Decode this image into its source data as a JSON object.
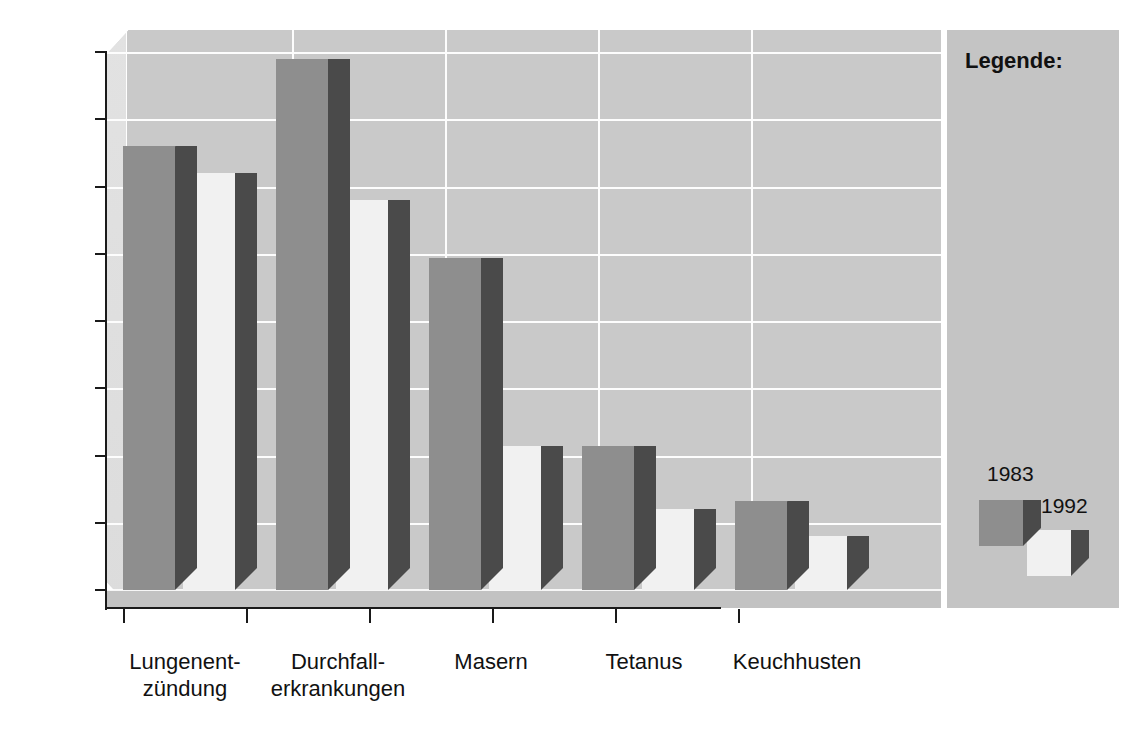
{
  "chart_data": {
    "type": "bar",
    "title": "",
    "xlabel": "",
    "ylabel": "",
    "ylim": [
      0,
      4
    ],
    "grid": true,
    "legend_position": "right",
    "legend_title": "Legende:",
    "categories": [
      "Lungenent-\nzündung",
      "Durchfall-\nerkrankungen",
      "Masern",
      "Tetanus",
      "Keuchhusten"
    ],
    "series": [
      {
        "name": "1983",
        "color": "#8e8e8e",
        "values": [
          3.3,
          3.95,
          2.47,
          1.07,
          0.66
        ]
      },
      {
        "name": "1992",
        "color": "#f1f1f1",
        "values": [
          3.1,
          2.9,
          1.07,
          0.6,
          0.4
        ]
      }
    ],
    "y_ticks": [
      {
        "value": 0,
        "label": "0"
      },
      {
        "value": 0.5,
        "label": "0,5"
      },
      {
        "value": 1,
        "label": "1"
      },
      {
        "value": 1.5,
        "label": "1,5"
      },
      {
        "value": 2,
        "label": "2"
      },
      {
        "value": 2.5,
        "label": "2,5"
      },
      {
        "value": 3,
        "label": "3"
      },
      {
        "value": 3.5,
        "label": "3,5"
      },
      {
        "value": 4,
        "label": "4"
      }
    ]
  },
  "legend": {
    "title": "Legende:",
    "entries": [
      {
        "label": "1983",
        "color": "#8e8e8e"
      },
      {
        "label": "1992",
        "color": "#f1f1f1"
      }
    ]
  }
}
